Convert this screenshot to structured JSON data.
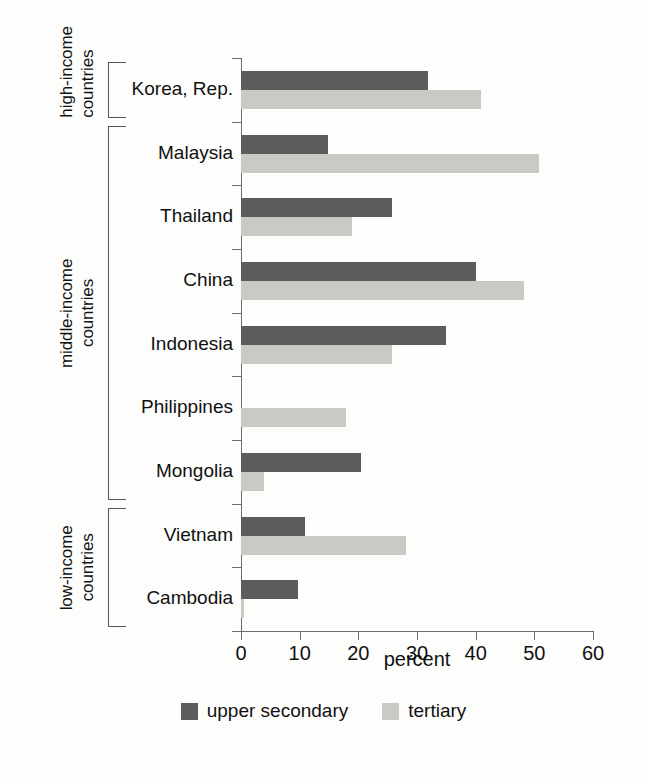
{
  "chart_data": {
    "type": "bar",
    "orientation": "horizontal",
    "title": "",
    "xlabel": "percent",
    "ylabel": "",
    "xlim": [
      0,
      60
    ],
    "xticks": [
      0,
      10,
      20,
      30,
      40,
      50,
      60
    ],
    "xticklabels": [
      "0",
      "10",
      "20",
      "30",
      "40",
      "50",
      "60"
    ],
    "grid": false,
    "legend_position": "bottom-center",
    "categories": [
      "Korea, Rep.",
      "Malaysia",
      "Thailand",
      "China",
      "Indonesia",
      "Philippines",
      "Mongolia",
      "Vietnam",
      "Cambodia"
    ],
    "series": [
      {
        "name": "upper secondary",
        "color": "#5c5c5c",
        "values": [
          31.8,
          14.9,
          25.8,
          40.0,
          35.0,
          0.0,
          20.5,
          10.9,
          9.8
        ]
      },
      {
        "name": "tertiary",
        "color": "#c9c9c5",
        "values": [
          40.9,
          50.8,
          19.0,
          48.2,
          25.8,
          17.9,
          3.9,
          28.2,
          0.5
        ]
      }
    ]
  },
  "groups": [
    {
      "label": "high-income\ncountries",
      "first": 0,
      "last": 0
    },
    {
      "label": "middle-income\ncountries",
      "first": 1,
      "last": 6
    },
    {
      "label": "low-income\ncountries",
      "first": 7,
      "last": 8
    }
  ],
  "legend": {
    "items": [
      {
        "label": "upper secondary",
        "swatch": "dark"
      },
      {
        "label": "tertiary",
        "swatch": "light"
      }
    ]
  }
}
